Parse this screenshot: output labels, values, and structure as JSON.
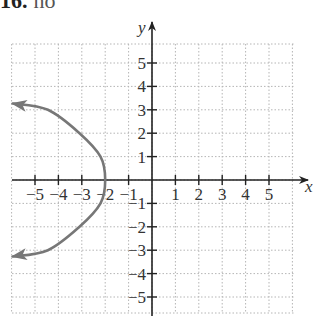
{
  "header": {
    "number": "16.",
    "text": "no"
  },
  "chart_data": {
    "type": "line",
    "title": "",
    "xlabel": "x",
    "ylabel": "y",
    "xlim": [
      -6,
      6
    ],
    "ylim": [
      -6,
      6
    ],
    "grid": true,
    "grid_style": "dotted",
    "x_ticks": [
      -5,
      -4,
      -3,
      -2,
      -1,
      1,
      2,
      3,
      4,
      5
    ],
    "y_ticks": [
      -5,
      -4,
      -3,
      -2,
      -1,
      1,
      2,
      3,
      4,
      5
    ],
    "x_tick_labels": [
      "−5",
      "−4",
      "−3",
      "−2",
      "−1",
      "1",
      "2",
      "3",
      "4",
      "5"
    ],
    "y_tick_labels": [
      "−5",
      "−4",
      "−3",
      "−2",
      "−1",
      "1",
      "2",
      "3",
      "4",
      "5"
    ],
    "series": [
      {
        "name": "parabola opening left, vertex (-2, 0)",
        "color": "#777777",
        "arrows_at_ends": true,
        "points": [
          {
            "x": -5.95,
            "y": 3.27
          },
          {
            "x": -4.45,
            "y": 3
          },
          {
            "x": -3.1,
            "y": 2
          },
          {
            "x": -2.2,
            "y": 1
          },
          {
            "x": -2,
            "y": 0
          },
          {
            "x": -2.2,
            "y": -1
          },
          {
            "x": -3.1,
            "y": -2
          },
          {
            "x": -4.45,
            "y": -3
          },
          {
            "x": -5.95,
            "y": -3.27
          }
        ]
      }
    ],
    "colors": {
      "axis": "#222222",
      "grid": "#b5b5b5",
      "curve": "#777777"
    }
  }
}
